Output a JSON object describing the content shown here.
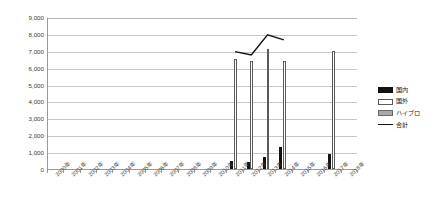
{
  "chart_data": {
    "type": "bar",
    "title": "",
    "xlabel": "",
    "ylabel": "",
    "ylim": [
      0,
      9000
    ],
    "ytick_step": 1000,
    "ytick_labels": [
      "9,000",
      "8,000",
      "7,000",
      "6,000",
      "5,000",
      "4,000",
      "3,000",
      "2,000",
      "1,000",
      "0"
    ],
    "grid": true,
    "legend_position": "right",
    "categories": [
      "2000年",
      "2001年",
      "2002年",
      "2003年",
      "2004年",
      "2005年",
      "2006年",
      "2007年",
      "2008年",
      "2009年",
      "2010年",
      "2011年",
      "2012年",
      "2013年",
      "2014年",
      "2015年",
      "2016年",
      "2017年",
      "2018年"
    ],
    "series": [
      {
        "name": "国内",
        "kind": "bar",
        "color": "#111111",
        "values": [
          null,
          null,
          null,
          null,
          null,
          null,
          null,
          null,
          null,
          null,
          null,
          500,
          400,
          700,
          1300,
          null,
          null,
          900,
          null
        ]
      },
      {
        "name": "国外",
        "kind": "bar",
        "color": "#ffffff",
        "values": [
          null,
          null,
          null,
          null,
          null,
          null,
          null,
          null,
          null,
          null,
          null,
          6500,
          6400,
          7100,
          6400,
          null,
          null,
          7000,
          null
        ]
      },
      {
        "name": "ハイブロ",
        "kind": "bar",
        "color": "#a8a8a8",
        "values": [
          null,
          null,
          null,
          null,
          null,
          null,
          null,
          null,
          null,
          null,
          null,
          null,
          null,
          null,
          null,
          null,
          null,
          null,
          null
        ]
      },
      {
        "name": "合計",
        "kind": "line",
        "color": "#111111",
        "values": [
          null,
          null,
          null,
          null,
          null,
          null,
          null,
          null,
          null,
          null,
          null,
          7000,
          6800,
          8000,
          7700,
          null,
          null,
          null,
          null
        ]
      }
    ]
  },
  "legend": {
    "items": [
      {
        "label": "国内",
        "key": "domestic"
      },
      {
        "label": "国外",
        "key": "overseas"
      },
      {
        "label": "ハイブロ",
        "key": "hybrid"
      },
      {
        "label": "合計",
        "key": "total"
      }
    ]
  }
}
